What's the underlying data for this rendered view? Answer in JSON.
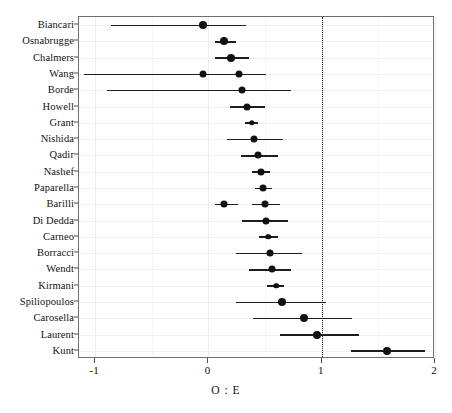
{
  "chart_data": {
    "type": "scatter",
    "subtype": "forest-plot",
    "title": "",
    "xlabel": "O : E",
    "ylabel": "",
    "xlim": [
      -1.143,
      2.0
    ],
    "xticks": [
      -1,
      0,
      1,
      2
    ],
    "xticklabels": [
      "-1",
      "0",
      "1",
      "2"
    ],
    "minor_gridlines_x": [
      -0.5,
      0.5,
      1.5
    ],
    "grid": true,
    "legend": false,
    "reference_line": {
      "x": 1,
      "style": "dotted"
    },
    "categories": [
      "Biancari",
      "Osnabrugge",
      "Chalmers",
      "Wang",
      "Borde",
      "Howell",
      "Grant",
      "Nishida",
      "Qadir",
      "Nashef",
      "Paparella",
      "Barilli",
      "Di Dedda",
      "Carneo",
      "Borracci",
      "Wendt",
      "Kirmani",
      "Spiliopoulos",
      "Carosella",
      "Laurent",
      "Kunt"
    ],
    "points": [
      {
        "label": "Biancari",
        "estimate": -0.05,
        "ci_low": -0.86,
        "ci_high": 0.33,
        "marker": "large"
      },
      {
        "label": "Osnabrugge",
        "estimate": 0.14,
        "ci_low": 0.06,
        "ci_high": 0.24,
        "marker": "large"
      },
      {
        "label": "Chalmers",
        "estimate": 0.2,
        "ci_low": 0.06,
        "ci_high": 0.36,
        "marker": "large"
      },
      {
        "label": "Wang",
        "estimate": 0.27,
        "ci_low": 0.07,
        "ci_high": 0.51,
        "marker": "medium",
        "extra": {
          "estimate": -0.05,
          "ci_low": -1.1,
          "ci_high": 0.51
        }
      },
      {
        "label": "Borde",
        "estimate": 0.3,
        "ci_low": -0.9,
        "ci_high": 0.73,
        "marker": "medium"
      },
      {
        "label": "Howell",
        "estimate": 0.34,
        "ci_low": 0.19,
        "ci_high": 0.5,
        "marker": "medium"
      },
      {
        "label": "Grant",
        "estimate": 0.38,
        "ci_low": 0.32,
        "ci_high": 0.44,
        "marker": "small"
      },
      {
        "label": "Nishida",
        "estimate": 0.4,
        "ci_low": 0.16,
        "ci_high": 0.66,
        "marker": "medium"
      },
      {
        "label": "Qadir",
        "estimate": 0.44,
        "ci_low": 0.29,
        "ci_high": 0.61,
        "marker": "medium"
      },
      {
        "label": "Nashef",
        "estimate": 0.46,
        "ci_low": 0.38,
        "ci_high": 0.54,
        "marker": "medium"
      },
      {
        "label": "Paparella",
        "estimate": 0.48,
        "ci_low": 0.41,
        "ci_high": 0.56,
        "marker": "medium"
      },
      {
        "label": "Barilli",
        "estimate": 0.5,
        "ci_low": 0.38,
        "ci_high": 0.63,
        "marker": "medium",
        "extra": {
          "estimate": 0.14,
          "ci_low": 0.06,
          "ci_high": 0.26
        }
      },
      {
        "label": "Di Dedda",
        "estimate": 0.51,
        "ci_low": 0.3,
        "ci_high": 0.7,
        "marker": "medium"
      },
      {
        "label": "Carneo",
        "estimate": 0.53,
        "ci_low": 0.45,
        "ci_high": 0.61,
        "marker": "small"
      },
      {
        "label": "Borracci",
        "estimate": 0.54,
        "ci_low": 0.24,
        "ci_high": 0.83,
        "marker": "medium"
      },
      {
        "label": "Wendt",
        "estimate": 0.56,
        "ci_low": 0.36,
        "ci_high": 0.73,
        "marker": "medium"
      },
      {
        "label": "Kirmani",
        "estimate": 0.6,
        "ci_low": 0.52,
        "ci_high": 0.67,
        "marker": "small"
      },
      {
        "label": "Spiliopoulos",
        "estimate": 0.65,
        "ci_low": 0.24,
        "ci_high": 1.04,
        "marker": "large"
      },
      {
        "label": "Carosella",
        "estimate": 0.84,
        "ci_low": 0.39,
        "ci_high": 1.27,
        "marker": "large"
      },
      {
        "label": "Laurent",
        "estimate": 0.96,
        "ci_low": 0.63,
        "ci_high": 1.33,
        "marker": "large"
      },
      {
        "label": "Kunt",
        "estimate": 1.58,
        "ci_low": 1.26,
        "ci_high": 1.91,
        "marker": "large"
      }
    ]
  },
  "axis": {
    "x_title": "O : E",
    "x_ticklabels": [
      "-1",
      "0",
      "1",
      "2"
    ]
  }
}
